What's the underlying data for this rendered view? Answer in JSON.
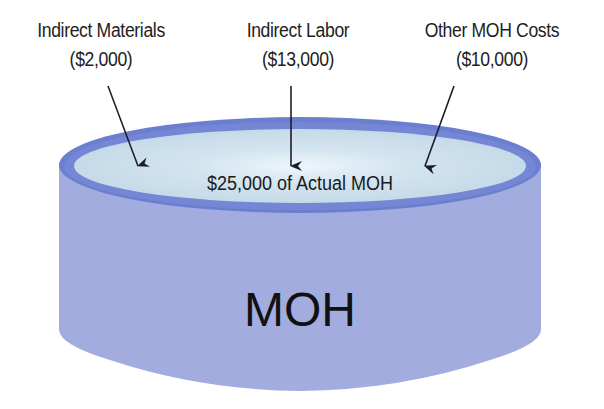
{
  "diagram": {
    "title": "MOH",
    "contents_label": "$25,000 of Actual MOH",
    "inputs": [
      {
        "name": "Indirect Materials",
        "amount": "($2,000)"
      },
      {
        "name": "Indirect Labor",
        "amount": "($13,000)"
      },
      {
        "name": "Other MOH Costs",
        "amount": "($10,000)"
      }
    ],
    "colors": {
      "cylinder_body": "#a3acdf",
      "cylinder_rim": "#6b7fd0",
      "liquid_surface": "#c7dcea",
      "liquid_highlight": "#eef6fb",
      "text": "#1e1e1e",
      "arrow": "#1c1c2a"
    }
  }
}
